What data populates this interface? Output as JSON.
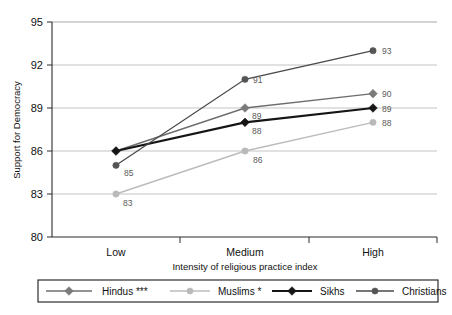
{
  "chart_data": {
    "type": "line",
    "title": "",
    "subtitle": "",
    "xlabel": "Intensity of religious practice index",
    "ylabel": "Support for Democracy",
    "categories": [
      "Low",
      "Medium",
      "High"
    ],
    "ylim": [
      80,
      95
    ],
    "yticks": [
      80,
      83,
      86,
      89,
      92,
      95
    ],
    "grid": true,
    "legend_position": "bottom",
    "series": [
      {
        "name": "Hindus ***",
        "key": "hindus",
        "marker": "diamond",
        "color": "#7a7a7a",
        "line_color": "#6e6e6e",
        "line_width": 1.4,
        "values": [
          86,
          89,
          90
        ],
        "labels": [
          "",
          "89",
          "90"
        ]
      },
      {
        "name": "Muslims *",
        "key": "muslims",
        "marker": "circle",
        "color": "#b9b9b9",
        "line_color": "#bcbcbc",
        "line_width": 1.4,
        "values": [
          83,
          86,
          88
        ],
        "labels": [
          "83",
          "86",
          "88"
        ]
      },
      {
        "name": "Sikhs",
        "key": "sikhs",
        "marker": "diamond",
        "color": "#151515",
        "line_color": "#151515",
        "line_width": 2.2,
        "values": [
          86,
          88,
          89
        ],
        "labels": [
          "",
          "88",
          "89"
        ]
      },
      {
        "name": "Christians",
        "key": "christians",
        "marker": "circle",
        "color": "#555555",
        "line_color": "#4a4a4a",
        "line_width": 1.3,
        "values": [
          85,
          91,
          93
        ],
        "labels": [
          "85",
          "91",
          "93"
        ]
      }
    ]
  },
  "axis": {
    "y_tick_labels": [
      "95",
      "92",
      "89",
      "86",
      "83",
      "80"
    ],
    "x_tick_labels": [
      "Low",
      "Medium",
      "High"
    ],
    "y_axis_title": "Support for Democracy",
    "x_axis_title": "Intensity of religious practice index"
  },
  "legend": {
    "items": [
      {
        "label": "Hindus ***"
      },
      {
        "label": "Muslims *"
      },
      {
        "label": "Sikhs"
      },
      {
        "label": "Christians"
      }
    ]
  },
  "point_labels": {
    "low": [
      "85",
      "83"
    ],
    "medium": [
      "91",
      "89",
      "88",
      "86"
    ],
    "high": [
      "93",
      "90",
      "89",
      "88"
    ]
  }
}
